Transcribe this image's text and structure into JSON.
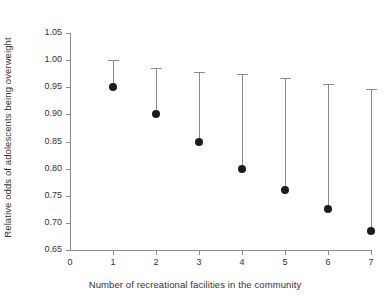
{
  "chart_data": {
    "type": "scatter",
    "title": "",
    "xlabel": "Number of recreational facilities in the community",
    "ylabel": "Relative odds of adolescents being overweight",
    "xlim": [
      0,
      7
    ],
    "ylim": [
      0.65,
      1.05
    ],
    "grid": false,
    "legend": null,
    "x_ticks": [
      "0",
      "1",
      "2",
      "3",
      "4",
      "5",
      "6",
      "7"
    ],
    "y_ticks": [
      "0.65",
      "0.70",
      "0.75",
      "0.80",
      "0.85",
      "0.90",
      "0.95",
      "1.00",
      "1.05"
    ],
    "x": [
      1,
      2,
      3,
      4,
      5,
      6,
      7
    ],
    "values": [
      0.95,
      0.9,
      0.85,
      0.8,
      0.76,
      0.725,
      0.685
    ],
    "error_upper": [
      1.0,
      0.985,
      0.978,
      0.974,
      0.967,
      0.956,
      0.947
    ],
    "series": [
      {
        "name": "Relative odds",
        "points": [
          {
            "x": 1,
            "y": 0.95,
            "ci_upper": 1.0
          },
          {
            "x": 2,
            "y": 0.9,
            "ci_upper": 0.985
          },
          {
            "x": 3,
            "y": 0.85,
            "ci_upper": 0.978
          },
          {
            "x": 4,
            "y": 0.8,
            "ci_upper": 0.974
          },
          {
            "x": 5,
            "y": 0.76,
            "ci_upper": 0.967
          },
          {
            "x": 6,
            "y": 0.725,
            "ci_upper": 0.956
          },
          {
            "x": 7,
            "y": 0.685,
            "ci_upper": 0.947
          }
        ]
      }
    ],
    "colors": {
      "marker": "#1c1c1c",
      "errorbar": "#8a8a8a",
      "axis": "#8c8c8c",
      "text": "#333333",
      "background": "#ffffff"
    }
  }
}
